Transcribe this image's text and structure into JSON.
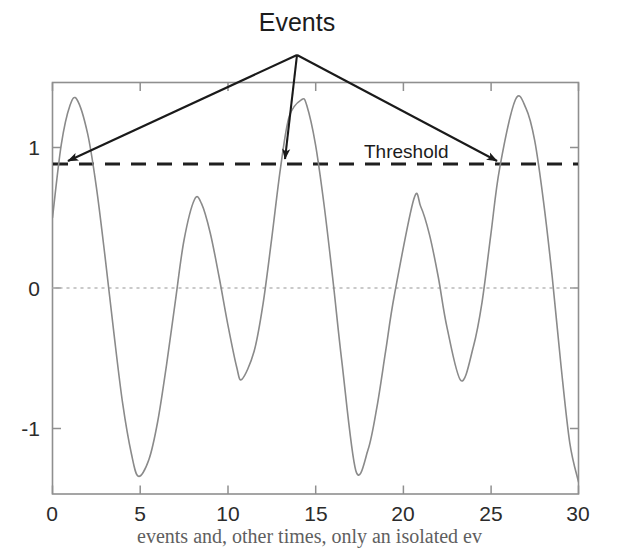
{
  "chart_data": {
    "type": "line",
    "title": "",
    "xlabel": "",
    "ylabel": "",
    "xlim": [
      0,
      30
    ],
    "ylim": [
      -1.45,
      1.45
    ],
    "grid": false,
    "legend_position": "none",
    "xticks": [
      0,
      5,
      10,
      15,
      20,
      25,
      30
    ],
    "xtick_labels": [
      "0",
      "5",
      "10",
      "15",
      "20",
      "25",
      "30"
    ],
    "yticks": [
      -1,
      0,
      1
    ],
    "ytick_labels": [
      "-1",
      "0",
      "1"
    ],
    "series": [
      {
        "name": "signal",
        "color": "#8a8a8a",
        "style": "solid",
        "linewidth": 1.6,
        "description": "Amplitude-modulated oscillation: y = sin(2*pi*t/6.35) + 0.38*sin(2*pi*t/12.7 + phase)",
        "x": [
          0,
          0.5,
          1,
          1.4,
          2,
          2.5,
          3,
          3.5,
          4,
          4.5,
          4.9,
          5.5,
          6,
          6.5,
          7,
          7.5,
          8.1,
          8.5,
          9,
          9.5,
          10,
          10.5,
          10.8,
          11.5,
          12,
          12.5,
          13,
          13.5,
          14.2,
          14.5,
          15,
          15.5,
          16,
          16.5,
          17.3,
          18,
          18.5,
          19,
          19.5,
          20.6,
          21,
          21.5,
          22,
          22.5,
          23.3,
          24,
          24.5,
          25,
          25.5,
          26.4,
          27,
          27.5,
          28,
          28.5,
          29,
          29.5,
          30
        ],
        "y": [
          0.5,
          1.02,
          1.3,
          1.34,
          1.1,
          0.72,
          0.22,
          -0.32,
          -0.82,
          -1.18,
          -1.34,
          -1.22,
          -0.95,
          -0.55,
          -0.1,
          0.34,
          0.63,
          0.6,
          0.39,
          0.08,
          -0.26,
          -0.56,
          -0.65,
          -0.45,
          -0.12,
          0.35,
          0.85,
          1.22,
          1.34,
          1.3,
          1.02,
          0.58,
          0.05,
          -0.52,
          -1.3,
          -1.15,
          -0.85,
          -0.45,
          -0.05,
          0.63,
          0.58,
          0.38,
          0.08,
          -0.28,
          -0.66,
          -0.42,
          -0.1,
          0.38,
          0.85,
          1.34,
          1.28,
          1.05,
          0.62,
          0.08,
          -0.55,
          -1.1,
          -1.38
        ]
      }
    ],
    "reference_lines": [
      {
        "name": "threshold",
        "label": "Threshold",
        "orientation": "horizontal",
        "value": 0.88,
        "style": "dashed",
        "color": "#1f1f1f",
        "linewidth": 3
      },
      {
        "name": "zero-line",
        "label": "",
        "orientation": "horizontal",
        "value": 0,
        "style": "dotted",
        "color": "#b9b9b9",
        "linewidth": 1.4
      }
    ],
    "annotations": [
      {
        "name": "events",
        "text": "Events",
        "kind": "multi-arrow-callout",
        "origin": {
          "x": 14.0,
          "y": 1.62
        },
        "targets": [
          {
            "x": 0.72,
            "y": 0.88
          },
          {
            "x": 13.05,
            "y": 0.88
          },
          {
            "x": 25.1,
            "y": 0.88
          }
        ]
      },
      {
        "name": "threshold-label",
        "text": "Threshold",
        "kind": "text",
        "position": {
          "x": 17.6,
          "y": 1.02
        }
      }
    ]
  },
  "annotations": {
    "events": "Events",
    "threshold": "Threshold"
  },
  "axes": {
    "x_tick_labels": [
      "0",
      "5",
      "10",
      "15",
      "20",
      "25",
      "30"
    ],
    "y_tick_labels": [
      "1",
      "0",
      "-1"
    ]
  },
  "footer": {
    "caption_fragment": "events and, other times, only an isolated ev"
  },
  "colors": {
    "curve": "#8a8a8a",
    "threshold": "#1f1f1f",
    "zero_line": "#b9b9b9",
    "frame": "#8f8f8f",
    "text": "#1c1c1c",
    "background": "#ffffff"
  }
}
